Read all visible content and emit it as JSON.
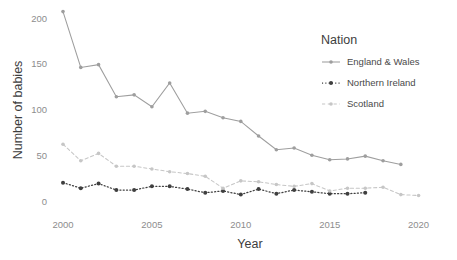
{
  "chart_data": {
    "type": "line",
    "title": "",
    "xlabel": "Year",
    "ylabel": "Number of babies",
    "xlim": [
      1999,
      2021
    ],
    "ylim": [
      0,
      215
    ],
    "xticks": [
      2000,
      2005,
      2010,
      2015,
      2020
    ],
    "yticks": [
      0,
      50,
      100,
      150,
      200
    ],
    "grid": false,
    "legend": {
      "title": "Nation",
      "position": "right",
      "entries": [
        {
          "name": "England & Wales",
          "color": "#9e9e9e",
          "dash": "solid"
        },
        {
          "name": "Northern Ireland",
          "color": "#3f3f3f",
          "dash": "dotted"
        },
        {
          "name": "Scotland",
          "color": "#c6c6c6",
          "dash": "dashed"
        }
      ]
    },
    "series": [
      {
        "name": "England & Wales",
        "color": "#9e9e9e",
        "dash": "solid",
        "x": [
          2000,
          2001,
          2002,
          2003,
          2004,
          2005,
          2006,
          2007,
          2008,
          2009,
          2010,
          2011,
          2012,
          2013,
          2014,
          2015,
          2016,
          2017,
          2018,
          2019
        ],
        "values": [
          207,
          146,
          149,
          114,
          116,
          103,
          129,
          96,
          98,
          91,
          87,
          71,
          56,
          58,
          50,
          45,
          46,
          49,
          44,
          40
        ]
      },
      {
        "name": "Northern Ireland",
        "color": "#3f3f3f",
        "dash": "dotted",
        "x": [
          2000,
          2001,
          2002,
          2003,
          2004,
          2005,
          2006,
          2007,
          2008,
          2009,
          2010,
          2011,
          2012,
          2013,
          2014,
          2015,
          2016,
          2017
        ],
        "values": [
          20,
          14,
          19,
          12,
          12,
          16,
          16,
          13,
          9,
          11,
          7,
          13,
          8,
          12,
          10,
          8,
          8,
          9
        ]
      },
      {
        "name": "Scotland",
        "color": "#c6c6c6",
        "dash": "dashed",
        "x": [
          2000,
          2001,
          2002,
          2003,
          2004,
          2005,
          2006,
          2007,
          2008,
          2009,
          2010,
          2011,
          2012,
          2013,
          2014,
          2015,
          2016,
          2017,
          2018,
          2019,
          2020
        ],
        "values": [
          62,
          44,
          52,
          38,
          38,
          35,
          32,
          30,
          27,
          14,
          22,
          21,
          18,
          16,
          19,
          11,
          14,
          14,
          15,
          7,
          6
        ]
      }
    ]
  },
  "axes": {
    "y_title": "Number of babies",
    "x_title": "Year",
    "y_tick_labels": [
      "200",
      "150",
      "100",
      "50",
      "0"
    ],
    "x_tick_labels": [
      "2000",
      "2005",
      "2010",
      "2015",
      "2020"
    ]
  },
  "legend_panel": {
    "title": "Nation",
    "items": [
      "England & Wales",
      "Northern Ireland",
      "Scotland"
    ]
  },
  "colors": {
    "england_wales": "#9e9e9e",
    "northern_ireland": "#3f3f3f",
    "scotland": "#c6c6c6",
    "axis_text": "#8d8d8d",
    "title_text": "#3d3d3d",
    "background": "#ffffff"
  }
}
